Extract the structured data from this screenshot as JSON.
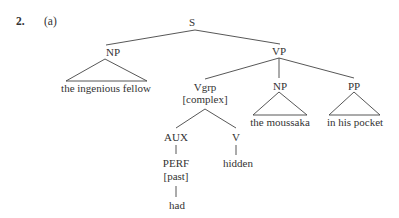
{
  "example": {
    "number": "2.",
    "sublabel": "(a)"
  },
  "tree": {
    "S": "S",
    "NP_subject": {
      "label": "NP",
      "text": "the ingenious fellow"
    },
    "VP": "VP",
    "Vgrp": {
      "label": "Vgrp",
      "feature": "[complex]"
    },
    "AUX": "AUX",
    "PERF": {
      "label": "PERF",
      "feature": "[past]",
      "word": "had"
    },
    "V": {
      "label": "V",
      "word": "hidden"
    },
    "NP_object": {
      "label": "NP",
      "text": "the moussaka"
    },
    "PP": {
      "label": "PP",
      "text": "in his pocket"
    }
  }
}
